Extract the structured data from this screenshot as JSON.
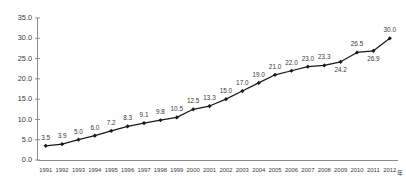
{
  "chart_data": {
    "type": "line",
    "title": "",
    "subtitle": "",
    "xlabel": "",
    "ylabel": "",
    "x_unit_suffix": "年",
    "categories": [
      "1991",
      "1992",
      "1993",
      "1994",
      "1995",
      "1996",
      "1997",
      "1998",
      "1999",
      "2000",
      "2001",
      "2002",
      "2003",
      "2004",
      "2005",
      "2006",
      "2007",
      "2008",
      "2009",
      "2010",
      "2011",
      "2012"
    ],
    "values": [
      3.5,
      3.9,
      5.0,
      6.0,
      7.2,
      8.3,
      9.1,
      9.8,
      10.5,
      12.5,
      13.3,
      15.0,
      17.0,
      19.0,
      21.0,
      22.0,
      23.0,
      23.3,
      24.2,
      26.5,
      26.9,
      30.0
    ],
    "point_labels": [
      "3.5",
      "3.9",
      "5.0",
      "6.0",
      "7.2",
      "8.3",
      "9.1",
      "9.8",
      "10.5",
      "12.5",
      "13.3",
      "15.0",
      "17.0",
      "19.0",
      "21.0",
      "22.0",
      "23.0",
      "23.3",
      "24.2",
      "26.5",
      "26.9",
      "30.0"
    ],
    "ylim": [
      0.0,
      35.0
    ],
    "ytick_values": [
      0.0,
      5.0,
      10.0,
      15.0,
      20.0,
      25.0,
      30.0,
      35.0
    ],
    "ytick_labels": [
      "0.0",
      "5.0",
      "10.0",
      "15.0",
      "20.0",
      "25.0",
      "30.0",
      "35.0"
    ],
    "grid": false,
    "legend": false,
    "legend_position": "none",
    "series_name": "",
    "marker": "diamond",
    "colors": {
      "line": "#1a1a1a",
      "marker": "#1a1a1a",
      "axis": "#8c8c8c",
      "text": "#3a3a3a",
      "background": "#ffffff"
    }
  }
}
